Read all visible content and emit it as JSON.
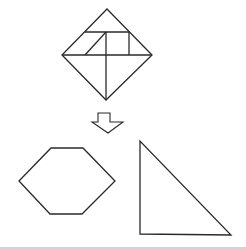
{
  "diagram": {
    "type": "tangram-puzzle",
    "stroke_color": "#2a2a2a",
    "background_color": "#ffffff",
    "source_shape": {
      "name": "square-rotated-45",
      "outline": [
        [
          107,
          9
        ],
        [
          152,
          55
        ],
        [
          106,
          100
        ],
        [
          62,
          55
        ]
      ],
      "inner_lines": [
        [
          [
            62,
            55
          ],
          [
            152,
            55
          ]
        ],
        [
          [
            85,
            32
          ],
          [
            129,
            32
          ]
        ],
        [
          [
            106,
            32
          ],
          [
            106,
            100
          ]
        ],
        [
          [
            85,
            55
          ],
          [
            106,
            32
          ]
        ],
        [
          [
            129,
            32
          ],
          [
            129,
            55
          ]
        ]
      ]
    },
    "arrow": {
      "direction": "down",
      "points": [
        [
          98,
          113
        ],
        [
          110,
          113
        ],
        [
          110,
          122
        ],
        [
          123,
          122
        ],
        [
          108,
          133
        ],
        [
          92,
          122
        ],
        [
          98,
          122
        ]
      ]
    },
    "target_shapes": [
      {
        "name": "hexagon",
        "points": [
          [
            19,
            181
          ],
          [
            51,
            148
          ],
          [
            83,
            148
          ],
          [
            115,
            181
          ],
          [
            82,
            214
          ],
          [
            50,
            214
          ]
        ]
      },
      {
        "name": "right-triangle",
        "points": [
          [
            140,
            141
          ],
          [
            140,
            234
          ],
          [
            231,
            235
          ]
        ]
      }
    ]
  }
}
